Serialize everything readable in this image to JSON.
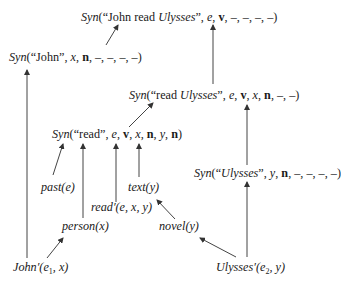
{
  "diagram": {
    "type": "semantic-syntactic derivation graph",
    "nodes": {
      "top": {
        "fn": "Syn",
        "open": "(“",
        "string_plain": "John read ",
        "string_italic": "Ulysses",
        "close_quote": "”, ",
        "var": "e",
        "sep1": ", ",
        "cat": "v",
        "rest": ", –, –, –, –)"
      },
      "john_syn": {
        "fn": "Syn",
        "open": "(“John”, ",
        "var": "x",
        "sep1": ", ",
        "cat": "n",
        "rest": ", –, –, –, –)"
      },
      "read_ulysses": {
        "fn": "Syn",
        "open": "(“read ",
        "string_italic": "Ulysses",
        "close_quote": "”, ",
        "var": "e",
        "sep1": ", ",
        "cat": "v",
        "sep2": ", ",
        "var2": "x",
        "sep3": ", ",
        "cat2": "n",
        "rest": ", –, –)"
      },
      "read_syn": {
        "fn": "Syn",
        "open": "(“read”, ",
        "var": "e",
        "sep1": ", ",
        "cat": "v",
        "sep2": ", ",
        "var2": "x",
        "sep3": ", ",
        "cat2": "n",
        "sep4": ", ",
        "var3": "y",
        "sep5": ", ",
        "cat3": "n",
        "rest": ")"
      },
      "ulysses_syn": {
        "fn": "Syn",
        "open": "(“",
        "string_italic": "Ulysses",
        "close_quote": "”, ",
        "var": "y",
        "sep1": ", ",
        "cat": "n",
        "rest": ", –, –, –, –)"
      },
      "past": {
        "label": "past(e)"
      },
      "text": {
        "label": "text(y)"
      },
      "read_prime": {
        "label": "read′(e, x, y)"
      },
      "person": {
        "label": "person(x)"
      },
      "novel": {
        "label": "novel(y)"
      },
      "john_prime": {
        "pred": "John′",
        "args_open": "(e",
        "sub": "1",
        "args_close": ", x)"
      },
      "ulysses_prime": {
        "pred": "Ulysses′",
        "args_open": "(e",
        "sub": "2",
        "args_close": ", y)"
      }
    },
    "edges": [
      {
        "from": "john_syn",
        "to": "top"
      },
      {
        "from": "read_ulysses",
        "to": "top"
      },
      {
        "from": "john_prime",
        "to": "john_syn"
      },
      {
        "from": "read_syn",
        "to": "read_ulysses"
      },
      {
        "from": "ulysses_syn",
        "to": "read_ulysses"
      },
      {
        "from": "past",
        "to": "read_syn"
      },
      {
        "from": "person",
        "to": "read_syn"
      },
      {
        "from": "read_prime",
        "to": "read_syn"
      },
      {
        "from": "text",
        "to": "read_syn"
      },
      {
        "from": "ulysses_prime",
        "to": "ulysses_syn"
      },
      {
        "from": "novel",
        "to": "text"
      },
      {
        "from": "ulysses_prime",
        "to": "novel"
      },
      {
        "from": "john_prime",
        "to": "person"
      }
    ],
    "colors": {
      "line": "#333333",
      "text": "#1a1a1a",
      "background": "#ffffff"
    }
  }
}
